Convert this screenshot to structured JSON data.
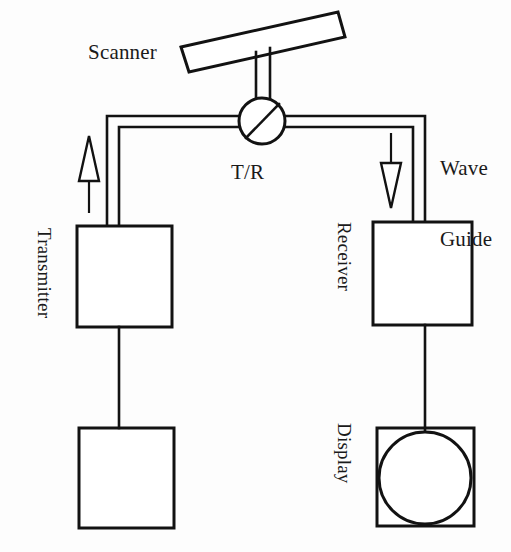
{
  "diagram": {
    "type": "block-diagram",
    "ink_color": "#121212",
    "background_color": "#fdfdfd",
    "labels": {
      "scanner": "Scanner",
      "tr_switch": "T/R",
      "wave_guide_line1": "Wave",
      "wave_guide_line2": "Guide",
      "transmitter": "Transmitter",
      "pulse_generator_line1": "Pulse",
      "pulse_generator_line2": "generator",
      "receiver": "Receiver",
      "display": "Display"
    },
    "blocks": [
      {
        "name": "transmitter",
        "label": "Transmitter",
        "x": 77,
        "y": 226,
        "w": 95,
        "h": 101,
        "contents": "empty"
      },
      {
        "name": "pulse-generator",
        "label": "Pulse generator",
        "x": 79,
        "y": 428,
        "w": 95,
        "h": 100,
        "contents": "empty"
      },
      {
        "name": "receiver",
        "label": "Receiver",
        "x": 373,
        "y": 222,
        "w": 99,
        "h": 103,
        "contents": "empty"
      },
      {
        "name": "display",
        "label": "Display",
        "x": 377,
        "y": 428,
        "w": 97,
        "h": 98,
        "contents": "circle"
      }
    ],
    "components": [
      {
        "name": "scanner-plate",
        "shape": "tilted-rectangle",
        "tilt_deg": -10
      },
      {
        "name": "tr-switch",
        "shape": "circle-with-diagonal",
        "cx": 262,
        "cy": 121,
        "r": 23
      },
      {
        "name": "waveguide",
        "shape": "double-line-channel"
      },
      {
        "name": "transmit-arrow",
        "direction": "up",
        "style": "hollow-triangle"
      },
      {
        "name": "receive-arrow",
        "direction": "down",
        "style": "hollow-triangle"
      },
      {
        "name": "display-trace",
        "shape": "circle",
        "cx": 425,
        "cy": 478,
        "r": 46
      }
    ],
    "connections": [
      {
        "from": "pulse-generator",
        "to": "transmitter",
        "style": "single-line"
      },
      {
        "from": "transmitter",
        "to": "tr-switch",
        "style": "waveguide"
      },
      {
        "from": "tr-switch",
        "to": "receiver",
        "style": "waveguide"
      },
      {
        "from": "tr-switch",
        "to": "scanner-plate",
        "style": "waveguide-stem"
      },
      {
        "from": "receiver",
        "to": "display",
        "style": "single-line"
      }
    ]
  }
}
